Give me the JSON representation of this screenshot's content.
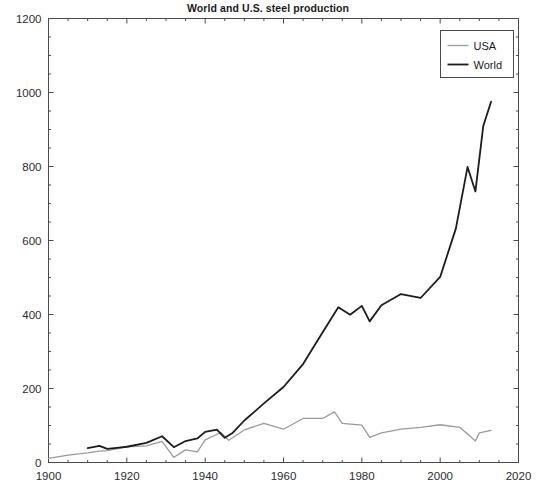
{
  "chart_data": {
    "type": "line",
    "title": "World and U.S. steel production",
    "xlabel": "",
    "ylabel": "",
    "xlim": [
      1900,
      2020
    ],
    "ylim": [
      0,
      1200
    ],
    "xticks": [
      1900,
      1920,
      1940,
      1960,
      1980,
      2000,
      2020
    ],
    "yticks": [
      0,
      200,
      400,
      600,
      800,
      1000,
      1200
    ],
    "xtick_labels": [
      "1900",
      "1920",
      "1940",
      "1960",
      "1980",
      "2000",
      "2020"
    ],
    "ytick_labels": [
      "0",
      "200",
      "400",
      "600",
      "800",
      "1000",
      "1200"
    ],
    "xminor_step": 5,
    "yminor_step": 50,
    "grid": false,
    "legend_position": "top-right",
    "series": [
      {
        "name": "USA",
        "color": "#9a9a9a",
        "linewidth": 1.3,
        "x": [
          1900,
          1905,
          1910,
          1913,
          1915,
          1920,
          1925,
          1929,
          1932,
          1935,
          1938,
          1940,
          1944,
          1946,
          1950,
          1955,
          1960,
          1965,
          1970,
          1973,
          1975,
          1980,
          1982,
          1985,
          1990,
          1995,
          2000,
          2005,
          2009,
          2010,
          2013
        ],
        "y": [
          11,
          20,
          26,
          31,
          32,
          42,
          45,
          57,
          14,
          34,
          29,
          61,
          81,
          60,
          88,
          106,
          90,
          119,
          119,
          137,
          106,
          101,
          68,
          80,
          90,
          95,
          102,
          95,
          58,
          80,
          87
        ]
      },
      {
        "name": "World",
        "color": "#1c1c1c",
        "linewidth": 1.8,
        "x": [
          1910,
          1913,
          1915,
          1918,
          1920,
          1925,
          1929,
          1932,
          1935,
          1938,
          1940,
          1943,
          1945,
          1947,
          1950,
          1955,
          1960,
          1965,
          1970,
          1974,
          1977,
          1980,
          1982,
          1985,
          1990,
          1995,
          2000,
          2004,
          2007,
          2009,
          2011,
          2013
        ]
      }
    ]
  },
  "legend": {
    "items": [
      {
        "label": "USA",
        "color": "#9a9a9a"
      },
      {
        "label": "World",
        "color": "#1c1c1c"
      }
    ]
  },
  "world_values": [
    66,
    76,
    62,
    68,
    72,
    90,
    120,
    70,
    98,
    110,
    140,
    150,
    113,
    135,
    192,
    270,
    345,
    450,
    595,
    710,
    675,
    716,
    645,
    719,
    770,
    752,
    848,
    1069,
    1351,
    1239,
    1538,
    1649
  ],
  "world_plot": {
    "x": [
      1910,
      1913,
      1915,
      1918,
      1920,
      1925,
      1929,
      1932,
      1935,
      1938,
      1940,
      1943,
      1945,
      1947,
      1950,
      1955,
      1960,
      1965,
      1970,
      1974,
      1977,
      1980,
      1982,
      1985,
      1990,
      1995,
      2000,
      2004,
      2007,
      2009,
      2011,
      2013
    ],
    "y": [
      66,
      76,
      62,
      68,
      72,
      90,
      120,
      70,
      98,
      110,
      140,
      150,
      113,
      135,
      192,
      270,
      345,
      450,
      595,
      710,
      675,
      716,
      645,
      719,
      770,
      752,
      848,
      1069,
      1351,
      1239,
      1538,
      1649
    ]
  }
}
